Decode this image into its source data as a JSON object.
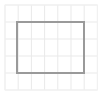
{
  "figure": {
    "title": "Rectangle outline on light graph-paper grid",
    "width": 102,
    "height": 95,
    "background_color": "#ffffff",
    "margin_color": "#fcfcfc"
  },
  "grid": {
    "line_color": "#e9e9e9",
    "line_width": 1,
    "origin_x": 5,
    "origin_y": 5,
    "spacing_x": 13.2,
    "spacing_y": 17,
    "columns": 7,
    "rows": 5,
    "vertical_lines_x": [
      5,
      18.2,
      31.4,
      44.6,
      57.8,
      71,
      84.2,
      97.4
    ],
    "horizontal_lines_y": [
      5,
      22,
      39,
      56,
      73,
      90
    ]
  },
  "outer_border": {
    "color": "#f2f2f2",
    "line_width": 1,
    "x": 5,
    "y": 5,
    "width": 92.4,
    "height": 85
  },
  "rectangle": {
    "label": "rectangle-shape",
    "stroke_color": "#9a9a9a",
    "fill_color": "none",
    "stroke_width": 2,
    "x": 17,
    "y": 22,
    "width": 67,
    "height": 51,
    "left": 17,
    "top": 22,
    "right": 84,
    "bottom": 73
  },
  "chart_data": {
    "type": "scatter",
    "title": "Rectangle outline on light graph-paper grid",
    "xlabel": "",
    "ylabel": "",
    "xlim": [
      0,
      102
    ],
    "ylim": [
      0,
      95
    ],
    "grid": true,
    "legend": "none",
    "annotations": [
      {
        "shape": "rectangle",
        "x": 17,
        "y": 22,
        "width": 67,
        "height": 51,
        "stroke": "#9a9a9a",
        "fill": "none",
        "stroke_width": 2
      }
    ]
  }
}
